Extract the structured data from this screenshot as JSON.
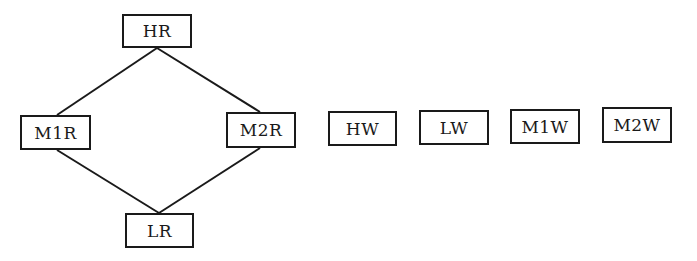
{
  "diagram": {
    "type": "lattice",
    "nodes": [
      {
        "id": "HR",
        "label": "HR",
        "x": 122,
        "y": 14,
        "w": 70,
        "h": 34
      },
      {
        "id": "M1R",
        "label": "M1R",
        "x": 20,
        "y": 115,
        "w": 71,
        "h": 35
      },
      {
        "id": "M2R",
        "label": "M2R",
        "x": 226,
        "y": 112,
        "w": 70,
        "h": 36
      },
      {
        "id": "LR",
        "label": "LR",
        "x": 125,
        "y": 213,
        "w": 69,
        "h": 35
      },
      {
        "id": "HW",
        "label": "HW",
        "x": 328,
        "y": 111,
        "w": 69,
        "h": 35
      },
      {
        "id": "LW",
        "label": "LW",
        "x": 419,
        "y": 110,
        "w": 70,
        "h": 35
      },
      {
        "id": "M1W",
        "label": "M1W",
        "x": 510,
        "y": 109,
        "w": 70,
        "h": 35
      },
      {
        "id": "M2W",
        "label": "M2W",
        "x": 602,
        "y": 107,
        "w": 70,
        "h": 36
      }
    ],
    "edges": [
      {
        "from": "HR",
        "to": "M1R",
        "x1": 157,
        "y1": 48,
        "x2": 57,
        "y2": 115
      },
      {
        "from": "HR",
        "to": "M2R",
        "x1": 157,
        "y1": 48,
        "x2": 260,
        "y2": 112
      },
      {
        "from": "M1R",
        "to": "LR",
        "x1": 57,
        "y1": 150,
        "x2": 159,
        "y2": 213
      },
      {
        "from": "M2R",
        "to": "LR",
        "x1": 260,
        "y1": 148,
        "x2": 159,
        "y2": 213
      }
    ],
    "colors": {
      "stroke": "#1a1a1a",
      "background": "#ffffff"
    }
  }
}
